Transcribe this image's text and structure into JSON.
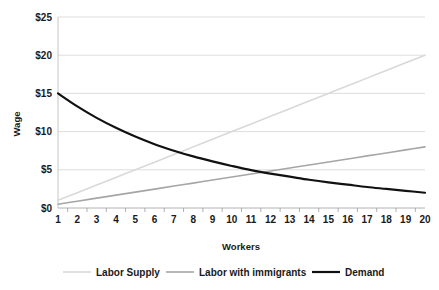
{
  "chart_data": {
    "type": "line",
    "title": "",
    "xlabel": "Workers",
    "ylabel": "Wage",
    "xlim": [
      1,
      20
    ],
    "ylim": [
      0,
      25
    ],
    "grid": true,
    "legend_position": "bottom",
    "x": [
      1,
      2,
      3,
      4,
      5,
      6,
      7,
      8,
      9,
      10,
      11,
      12,
      13,
      14,
      15,
      16,
      17,
      18,
      19,
      20
    ],
    "x_tick_labels": [
      "1",
      "2",
      "3",
      "4",
      "5",
      "6",
      "7",
      "8",
      "9",
      "10",
      "11",
      "12",
      "13",
      "14",
      "15",
      "16",
      "17",
      "18",
      "19",
      "20"
    ],
    "y_ticks": [
      0,
      5,
      10,
      15,
      20,
      25
    ],
    "y_tick_labels": [
      "$0",
      "$5",
      "$10",
      "$15",
      "$20",
      "$25"
    ],
    "series": [
      {
        "name": "Labor Supply",
        "color": "#d9d9d9",
        "width": 1.6,
        "values": [
          1.0,
          2.0,
          3.0,
          4.0,
          5.0,
          6.0,
          7.0,
          8.0,
          9.0,
          10.0,
          11.0,
          12.0,
          13.0,
          14.0,
          15.0,
          16.0,
          17.0,
          18.0,
          19.0,
          20.0
        ]
      },
      {
        "name": "Labor with immigrants",
        "color": "#a6a6a6",
        "width": 1.6,
        "values": [
          0.5,
          0.89,
          1.29,
          1.68,
          2.08,
          2.47,
          2.87,
          3.26,
          3.66,
          4.05,
          4.45,
          4.84,
          5.24,
          5.63,
          6.03,
          6.42,
          6.82,
          7.21,
          7.61,
          8.0
        ]
      },
      {
        "name": "Demand",
        "color": "#111111",
        "width": 2.2,
        "values": [
          15.0,
          13.3,
          11.8,
          10.5,
          9.35,
          8.35,
          7.5,
          6.75,
          6.1,
          5.5,
          4.95,
          4.5,
          4.1,
          3.7,
          3.35,
          3.05,
          2.75,
          2.5,
          2.25,
          2.0
        ]
      }
    ]
  },
  "legend": {
    "items": [
      {
        "label": "Labor Supply",
        "color": "#d9d9d9"
      },
      {
        "label": "Labor with immigrants",
        "color": "#a6a6a6"
      },
      {
        "label": "Demand",
        "color": "#111111"
      }
    ]
  }
}
